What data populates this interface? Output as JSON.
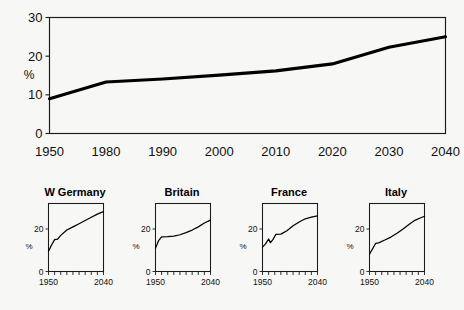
{
  "figure": {
    "background_color": "#f7f7f5",
    "line_color": "#000000",
    "axis_color": "#1a1a1a"
  },
  "chart_data": [
    {
      "id": "main",
      "type": "line",
      "title": "",
      "xlabel": "",
      "ylabel": "%",
      "ylim": [
        0,
        30
      ],
      "yticks": [
        0,
        10,
        20,
        30
      ],
      "ytick_labels": [
        "0",
        "10",
        "20",
        "30"
      ],
      "xticks": [
        1950,
        1980,
        1990,
        2000,
        2010,
        2020,
        2030,
        2040
      ],
      "xtick_labels": [
        "1950",
        "1980",
        "1990",
        "2000",
        "2010",
        "2020",
        "2030",
        "2040"
      ],
      "grid": false,
      "legend": "none",
      "x": [
        1950,
        1980,
        1990,
        2000,
        2010,
        2020,
        2030,
        2040
      ],
      "values": [
        9.0,
        13.3,
        14.1,
        15.1,
        16.2,
        18.0,
        22.3,
        25.0
      ]
    },
    {
      "id": "w-germany",
      "type": "line",
      "title": "W Germany",
      "xlabel": "",
      "ylabel": "%",
      "ylim": [
        0,
        32
      ],
      "yticks": [
        0,
        20
      ],
      "ytick_labels": [
        "0",
        "20"
      ],
      "xticks": [
        1950,
        2040
      ],
      "xtick_labels": [
        "1950",
        "2040"
      ],
      "minor_xticks": [
        1950,
        1960,
        1970,
        1980,
        1990,
        2000,
        2010,
        2020,
        2030,
        2040
      ],
      "grid": false,
      "legend": "none",
      "x": [
        1950,
        1955,
        1960,
        1965,
        1970,
        1980,
        1990,
        2000,
        2010,
        2020,
        2030,
        2040
      ],
      "values": [
        9.5,
        12.5,
        15.0,
        15.2,
        17.0,
        19.5,
        21.0,
        22.5,
        24.0,
        25.5,
        27.0,
        28.2
      ]
    },
    {
      "id": "britain",
      "type": "line",
      "title": "Britain",
      "xlabel": "",
      "ylabel": "%",
      "ylim": [
        0,
        32
      ],
      "yticks": [
        0,
        20
      ],
      "ytick_labels": [
        "0",
        "20"
      ],
      "xticks": [
        1950,
        2040
      ],
      "xtick_labels": [
        "1950",
        "2040"
      ],
      "minor_xticks": [
        1950,
        1960,
        1970,
        1980,
        1990,
        2000,
        2010,
        2020,
        2030,
        2040
      ],
      "grid": false,
      "legend": "none",
      "x": [
        1950,
        1955,
        1960,
        1970,
        1980,
        1990,
        2000,
        2010,
        2020,
        2030,
        2040
      ],
      "values": [
        11.0,
        14.5,
        16.3,
        16.4,
        16.6,
        17.3,
        18.3,
        19.5,
        21.0,
        22.8,
        24.2
      ]
    },
    {
      "id": "france",
      "type": "line",
      "title": "France",
      "xlabel": "",
      "ylabel": "%",
      "ylim": [
        0,
        32
      ],
      "yticks": [
        0,
        20
      ],
      "ytick_labels": [
        "0",
        "20"
      ],
      "xticks": [
        1950,
        2040
      ],
      "xtick_labels": [
        "1950",
        "2040"
      ],
      "minor_xticks": [
        1950,
        1960,
        1970,
        1980,
        1990,
        2000,
        2010,
        2020,
        2030,
        2040
      ],
      "grid": false,
      "legend": "none",
      "x": [
        1950,
        1955,
        1960,
        1963,
        1967,
        1972,
        1980,
        1990,
        2000,
        2010,
        2020,
        2030,
        2040
      ],
      "values": [
        11.5,
        13.0,
        15.3,
        13.6,
        15.0,
        17.5,
        17.6,
        19.2,
        21.5,
        23.3,
        24.8,
        25.6,
        26.2
      ]
    },
    {
      "id": "italy",
      "type": "line",
      "title": "Italy",
      "xlabel": "",
      "ylabel": "%",
      "ylim": [
        0,
        32
      ],
      "yticks": [
        0,
        20
      ],
      "ytick_labels": [
        "0",
        "20"
      ],
      "xticks": [
        1950,
        2040
      ],
      "xtick_labels": [
        "1950",
        "2040"
      ],
      "minor_xticks": [
        1950,
        1960,
        1970,
        1980,
        1990,
        2000,
        2010,
        2020,
        2030,
        2040
      ],
      "grid": false,
      "legend": "none",
      "x": [
        1950,
        1960,
        1965,
        1975,
        1985,
        1995,
        2005,
        2015,
        2025,
        2035,
        2040
      ],
      "values": [
        8.2,
        13.2,
        13.5,
        14.8,
        16.2,
        18.0,
        20.0,
        22.2,
        24.2,
        25.4,
        26.0
      ]
    }
  ],
  "main_chart": {
    "ylabel": "%",
    "ytick_labels": [
      "0",
      "10",
      "20",
      "30"
    ],
    "xtick_labels": [
      "1950",
      "1980",
      "1990",
      "2000",
      "2010",
      "2020",
      "2030",
      "2040"
    ]
  },
  "panels": [
    {
      "title": "W Germany",
      "ylabel": "%",
      "ytick_labels": [
        "0",
        "20"
      ],
      "xtick_labels": [
        "1950",
        "2040"
      ]
    },
    {
      "title": "Britain",
      "ylabel": "%",
      "ytick_labels": [
        "0",
        "20"
      ],
      "xtick_labels": [
        "1950",
        "2040"
      ]
    },
    {
      "title": "France",
      "ylabel": "%",
      "ytick_labels": [
        "0",
        "20"
      ],
      "xtick_labels": [
        "1950",
        "2040"
      ]
    },
    {
      "title": "Italy",
      "ylabel": "%",
      "ytick_labels": [
        "0",
        "20"
      ],
      "xtick_labels": [
        "1950",
        "2040"
      ]
    }
  ]
}
